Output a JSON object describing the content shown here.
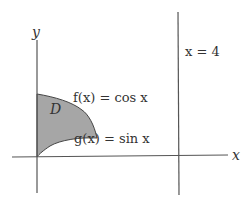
{
  "diagram": {
    "axes": {
      "x_label": "x",
      "y_label": "y"
    },
    "curves": {
      "upper": "f(x) = cos x",
      "lower": "g(x) = sin x"
    },
    "vertical_line": "x = 4",
    "region_label": "D",
    "colors": {
      "region_fill": "#a6a6a6",
      "region_stroke": "#444444",
      "axis": "#555555",
      "text": "#333333"
    }
  }
}
